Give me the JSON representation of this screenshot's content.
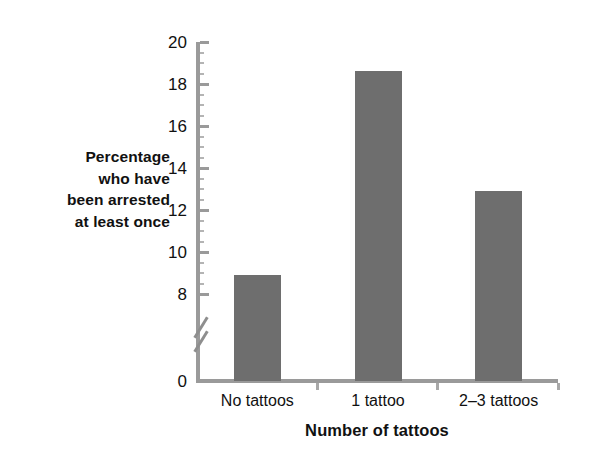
{
  "chart_data": {
    "type": "bar",
    "title": "",
    "categories": [
      "No tattoos",
      "1 tattoo",
      "2–3 tattoos"
    ],
    "values": [
      8.9,
      18.6,
      12.9
    ],
    "xlabel": "Number of tattoos",
    "ylabel": "Percentage who have been arrested at least once",
    "ylabel_lines": [
      "Percentage",
      "who have",
      "been arrested",
      "at least once"
    ],
    "ylim": [
      0,
      20
    ],
    "y_ticks": [
      0,
      8,
      10,
      12,
      14,
      16,
      18,
      20
    ],
    "y_tick_labels": [
      "0",
      "8",
      "10",
      "12",
      "14",
      "16",
      "18",
      "20"
    ],
    "axis_break": true,
    "axis_break_between": [
      0,
      8
    ],
    "grid": false,
    "legend": null,
    "bar_color": "#6e6e6e",
    "axis_color": "#9a9a9a",
    "background": "#ffffff"
  },
  "yaxis": {
    "label_lines": [
      "Percentage",
      "who have",
      "been arrested",
      "at least once"
    ],
    "ticks": [
      {
        "label": "20",
        "value": 20
      },
      {
        "label": "18",
        "value": 18
      },
      {
        "label": "16",
        "value": 16
      },
      {
        "label": "14",
        "value": 14
      },
      {
        "label": "12",
        "value": 12
      },
      {
        "label": "10",
        "value": 10
      },
      {
        "label": "8",
        "value": 8
      },
      {
        "label": "0",
        "value": 0
      }
    ]
  },
  "xaxis": {
    "title": "Number of tattoos",
    "categories": [
      "No tattoos",
      "1 tattoo",
      "2–3 tattoos"
    ]
  },
  "bars": [
    {
      "category": "No tattoos",
      "value": 8.9
    },
    {
      "category": "1 tattoo",
      "value": 18.6
    },
    {
      "category": "2–3 tattoos",
      "value": 12.9
    }
  ]
}
